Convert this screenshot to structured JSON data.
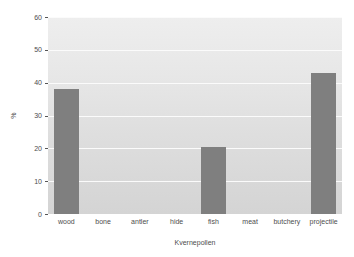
{
  "chart_data": {
    "type": "bar",
    "title": "",
    "xlabel": "Kvernepollen",
    "ylabel": "%",
    "categories": [
      "wood",
      "bone",
      "antler",
      "hide",
      "fish",
      "meat",
      "butchery",
      "projectile"
    ],
    "values": [
      38,
      0,
      0,
      0,
      20.5,
      0,
      0,
      43
    ],
    "ylim": [
      0,
      60
    ],
    "yticks": [
      0,
      10,
      20,
      30,
      40,
      50,
      60
    ],
    "ytick_labels": [
      "0",
      "10",
      "20",
      "30",
      "40",
      "50",
      "60"
    ],
    "grid": true,
    "legend": "none",
    "bar_color": "#7f7f7f",
    "plot_background": "#e4e4e4",
    "gridline_color": "#fbfbfb",
    "figure_background": "#ffffff",
    "text_color": "#4d4d4d"
  }
}
